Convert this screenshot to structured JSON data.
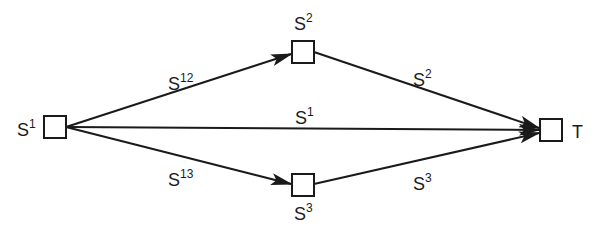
{
  "diagram": {
    "type": "directed-network",
    "colors": {
      "stroke": "#1a1a1a",
      "background": "#ffffff",
      "node_fill": "#ffffff"
    },
    "nodes": [
      {
        "id": "S1",
        "label_base": "S",
        "label_sup": "1",
        "label_position": "left"
      },
      {
        "id": "S2",
        "label_base": "S",
        "label_sup": "2",
        "label_position": "above"
      },
      {
        "id": "S3",
        "label_base": "S",
        "label_sup": "3",
        "label_position": "below"
      },
      {
        "id": "T",
        "label_base": "T",
        "label_sup": "",
        "label_position": "right"
      }
    ],
    "edges": [
      {
        "from": "S1",
        "to": "S2",
        "label_base": "S",
        "label_sup": "12"
      },
      {
        "from": "S2",
        "to": "T",
        "label_base": "S",
        "label_sup": "2"
      },
      {
        "from": "S1",
        "to": "T",
        "label_base": "S",
        "label_sup": "1"
      },
      {
        "from": "S1",
        "to": "S3",
        "label_base": "S",
        "label_sup": "13"
      },
      {
        "from": "S3",
        "to": "T",
        "label_base": "S",
        "label_sup": "3"
      }
    ]
  }
}
